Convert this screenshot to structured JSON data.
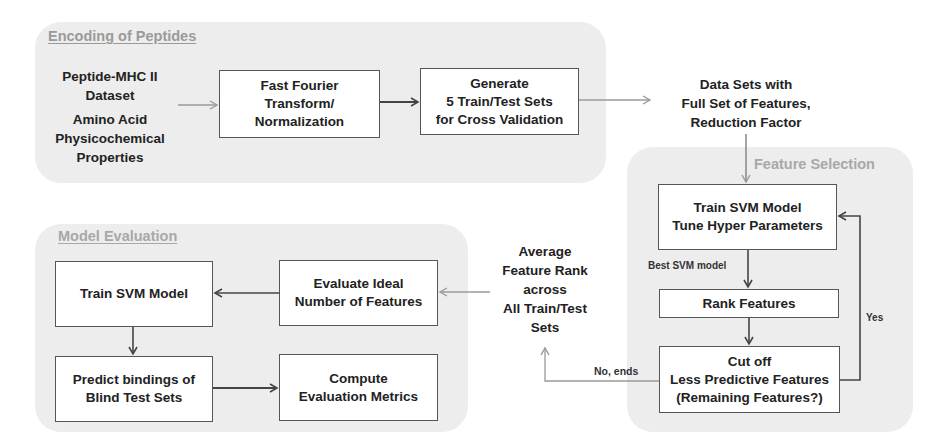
{
  "panels": {
    "encoding": {
      "title": "Encoding of Peptides"
    },
    "feature_selection": {
      "title": "Feature Selection"
    },
    "model_evaluation": {
      "title": "Model Evaluation"
    }
  },
  "encoding": {
    "input_1": "Peptide-MHC II\nDataset",
    "input_2": "Amino Acid\nPhysicochemical\nProperties",
    "fft_box": "Fast Fourier\nTransform/\nNormalization",
    "generate_box": "Generate\n5 Train/Test Sets\nfor Cross Validation"
  },
  "datasets_text": "Data Sets with\nFull Set of Features,\nReduction Factor",
  "feature_selection": {
    "train_box": "Train SVM Model\nTune Hyper Parameters",
    "best_model_label": "Best SVM model",
    "rank_box": "Rank Features",
    "cutoff_box": "Cut off\nLess Predictive Features\n(Remaining Features?)",
    "yes_label": "Yes",
    "no_label": "No, ends"
  },
  "average_rank_text": "Average\nFeature Rank\nacross\nAll Train/Test\nSets",
  "model_evaluation": {
    "train_box": "Train SVM Model",
    "evaluate_box": "Evaluate Ideal\nNumber of Features",
    "predict_box": "Predict bindings of\nBlind Test Sets",
    "compute_box": "Compute\nEvaluation Metrics"
  },
  "colors": {
    "panel_bg": "#ededed",
    "panel_title": "#9a9a9a",
    "dark_arrow": "#444444",
    "light_arrow": "#9a9a9a",
    "box_border": "#555555"
  }
}
